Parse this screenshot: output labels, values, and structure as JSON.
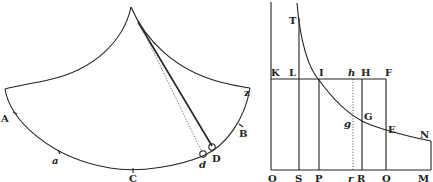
{
  "figure_left": {
    "title": "cycloidal pendulum",
    "labels": {
      "A": "A",
      "a": "a",
      "C": "C",
      "d": "d",
      "D": "D",
      "B": "B",
      "Z": "z"
    }
  },
  "figure_right": {
    "title": "hyperbola with ordinates",
    "labels": {
      "T": "T",
      "K": "K",
      "L": "L",
      "I": "I",
      "h": "h",
      "H": "H",
      "F": "F",
      "g": "g",
      "G": "G",
      "E": "E",
      "N": "N",
      "O": "O",
      "S": "S",
      "P": "P",
      "r": "r",
      "R": "R",
      "Q": "Q",
      "M": "M"
    }
  },
  "colors": {
    "ink": "#222222",
    "paper": "#ffffff"
  }
}
